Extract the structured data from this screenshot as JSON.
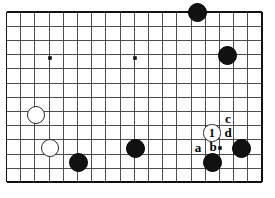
{
  "diagram": {
    "kind": "go-board-diagram",
    "board": {
      "columns": 19,
      "rows": 13,
      "origin_x": 6.5,
      "origin_y": 12.0,
      "spacing": 14.2,
      "line_color": "#3a3a3a",
      "border_color": "#111111",
      "background_color": "#ffffff",
      "grid_on": true
    },
    "star_points": [
      {
        "name": "hoshi-left",
        "x": 50,
        "y": 58
      },
      {
        "name": "hoshi-center",
        "x": 135,
        "y": 58
      },
      {
        "name": "hoshi-right",
        "x": 220,
        "y": 148
      }
    ],
    "stones": [
      {
        "name": "black-stone-top",
        "color": "black",
        "x": 197,
        "y": 12,
        "r": 9.5,
        "label": ""
      },
      {
        "name": "black-stone-upper-right",
        "color": "black",
        "x": 227,
        "y": 55,
        "r": 9.5,
        "label": ""
      },
      {
        "name": "white-stone-upper-left",
        "color": "white",
        "x": 36,
        "y": 115,
        "r": 9.0,
        "label": ""
      },
      {
        "name": "white-stone-lower-left",
        "color": "white",
        "x": 50,
        "y": 148,
        "r": 9.0,
        "label": ""
      },
      {
        "name": "black-stone-lower-left",
        "color": "black",
        "x": 78,
        "y": 162,
        "r": 9.5,
        "label": ""
      },
      {
        "name": "black-stone-center-bottom",
        "color": "black",
        "x": 135,
        "y": 148,
        "r": 9.5,
        "label": ""
      },
      {
        "name": "black-stone-below-b",
        "color": "black",
        "x": 212,
        "y": 162,
        "r": 9.5,
        "label": ""
      },
      {
        "name": "black-stone-right-edge",
        "color": "black",
        "x": 241,
        "y": 148,
        "r": 9.5,
        "label": ""
      },
      {
        "name": "white-stone-move-1",
        "color": "white",
        "x": 212,
        "y": 133,
        "r": 8.6,
        "label": "1"
      }
    ],
    "point_markers": [
      {
        "name": "point-label-a",
        "text": "a",
        "x": 198,
        "y": 148
      },
      {
        "name": "point-label-b",
        "text": "b",
        "x": 213,
        "y": 147
      },
      {
        "name": "point-label-c",
        "text": "c",
        "x": 228,
        "y": 119
      },
      {
        "name": "point-label-d",
        "text": "d",
        "x": 228,
        "y": 133
      }
    ]
  }
}
